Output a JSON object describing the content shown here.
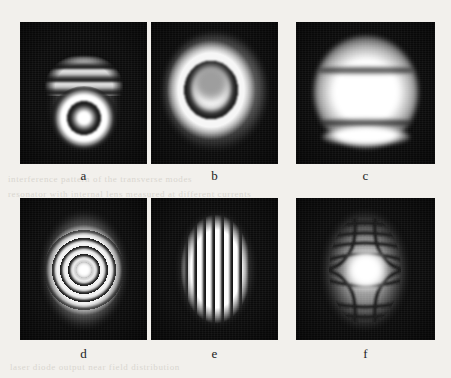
{
  "figure": {
    "kind": "interferogram-photo-grid",
    "rows": 2,
    "columns": 3,
    "background_color": "#f2f0ec",
    "panel_background": "#0b0b0b",
    "ghost_text": [
      {
        "text": "interference  pattern  of  the  transverse  modes",
        "x": 8,
        "y": 174
      },
      {
        "text": "resonator  with  internal  lens  measured  at  different  currents",
        "x": 8,
        "y": 189
      },
      {
        "text": "laser  diode  output  near  field  distribution",
        "x": 10,
        "y": 362
      }
    ],
    "panels": [
      {
        "id": "a",
        "label": "a",
        "pattern": "horizontal arc fringes above a bright ringed core",
        "fringe_count": 4,
        "fringe_orientation": "horizontal-arcs"
      },
      {
        "id": "b",
        "label": "b",
        "pattern": "concentric circular fringes with large saturated central disc",
        "fringe_count": 4,
        "fringe_orientation": "circular"
      },
      {
        "id": "c",
        "label": "c",
        "pattern": "large saturated spot with two broad horizontal fringes",
        "fringe_count": 2,
        "fringe_orientation": "horizontal-broad"
      },
      {
        "id": "d",
        "label": "d",
        "pattern": "dense concentric ring fringes centred on a bright core, elongated vertical envelope",
        "fringe_count": 10,
        "fringe_orientation": "circular-fine"
      },
      {
        "id": "e",
        "label": "e",
        "pattern": "straight vertical fringes across an elliptical beam spot",
        "fringe_count": 11,
        "fringe_orientation": "vertical-straight"
      },
      {
        "id": "f",
        "label": "f",
        "pattern": "hyperbolic saddle fringes forming an X-shaped bright star centre",
        "fringe_count": 12,
        "fringe_orientation": "hyperbolic-saddle"
      }
    ]
  }
}
